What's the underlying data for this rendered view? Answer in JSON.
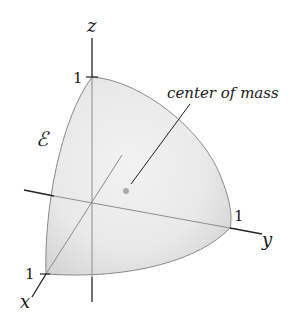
{
  "diagram": {
    "region_label": "ℰ",
    "axes": {
      "x": {
        "label": "x",
        "tick": "1"
      },
      "y": {
        "label": "y",
        "tick": "1"
      },
      "z": {
        "label": "z",
        "tick": "1"
      }
    },
    "annotation": "center of mass",
    "colors": {
      "surface_fill": "#e6e6e6",
      "surface_edge": "#8a8a8a",
      "axis": "#222222",
      "hidden_axis": "#8c8c8c",
      "dot": "#a8a8a8"
    }
  }
}
